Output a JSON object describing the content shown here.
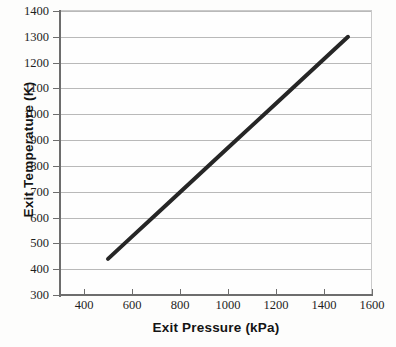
{
  "chart_data": {
    "type": "line",
    "title": "",
    "xlabel": "Exit Pressure (kPa)",
    "ylabel": "Exit Temperature (K)",
    "xlim": [
      300,
      1600
    ],
    "ylim": [
      300,
      1400
    ],
    "xticks": [
      400,
      600,
      800,
      1000,
      1200,
      1400,
      1600
    ],
    "yticks": [
      300,
      400,
      500,
      600,
      700,
      800,
      900,
      1000,
      1100,
      1200,
      1300,
      1400
    ],
    "xtick_labels": [
      "400",
      "600",
      "800",
      "1000",
      "1200",
      "1400",
      "1600"
    ],
    "ytick_labels": [
      "300",
      "400",
      "500",
      "600",
      "700",
      "800",
      "900",
      "1000",
      "1100",
      "1200",
      "1300",
      "1400"
    ],
    "grid": "horizontal",
    "legend": null,
    "series": [
      {
        "name": "Exit temperature vs exit pressure",
        "x": [
          500,
          600,
          700,
          800,
          900,
          1000,
          1100,
          1200,
          1300,
          1400,
          1500
        ],
        "y": [
          440,
          526,
          612,
          698,
          784,
          870,
          956,
          1042,
          1128,
          1214,
          1300
        ],
        "color": "#262626",
        "line_width": 4,
        "markers": "none"
      }
    ],
    "annotations": []
  },
  "axes": {
    "x_title": "Exit Pressure (kPa)",
    "y_title": "Exit Temperature (K)",
    "x_ticks": [
      {
        "value": 400,
        "label": "400"
      },
      {
        "value": 600,
        "label": "600"
      },
      {
        "value": 800,
        "label": "800"
      },
      {
        "value": 1000,
        "label": "1000"
      },
      {
        "value": 1200,
        "label": "1200"
      },
      {
        "value": 1400,
        "label": "1400"
      },
      {
        "value": 1600,
        "label": "1600"
      }
    ],
    "y_ticks": [
      {
        "value": 1400,
        "label": "1400"
      },
      {
        "value": 1300,
        "label": "1300"
      },
      {
        "value": 1200,
        "label": "1200"
      },
      {
        "value": 1100,
        "label": "1100"
      },
      {
        "value": 1000,
        "label": "1000"
      },
      {
        "value": 900,
        "label": "900"
      },
      {
        "value": 800,
        "label": "800"
      },
      {
        "value": 700,
        "label": "700"
      },
      {
        "value": 600,
        "label": "600"
      },
      {
        "value": 500,
        "label": "500"
      },
      {
        "value": 400,
        "label": "400"
      },
      {
        "value": 300,
        "label": "300"
      }
    ]
  },
  "colors": {
    "series_line": "#262626",
    "axis": "#6d6d6d",
    "gridline": "#b9b9b9",
    "text": "#1e1e1e",
    "title_text": "#141414",
    "background": "#fdfdfc",
    "plot_background": "#fefefe"
  }
}
